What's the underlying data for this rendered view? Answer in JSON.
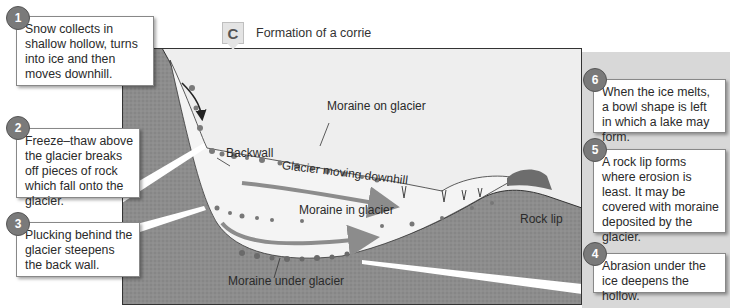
{
  "diagram": {
    "badge": "C",
    "title": "Formation of a corrie",
    "colors": {
      "rock": "#8a8a8a",
      "ice": "#eeeeee",
      "arrow": "#8c8c8c",
      "callout_number_bg": "#7a7a7a",
      "side_panel": "#d8d8d8"
    },
    "callouts": [
      {
        "number": "1",
        "text": "Snow collects in shallow hollow, turns into ice and then moves downhill."
      },
      {
        "number": "2",
        "text": "Freeze–thaw above the glacier breaks off pieces of rock which fall onto the glacier."
      },
      {
        "number": "3",
        "text": "Plucking behind the glacier steepens the back wall."
      },
      {
        "number": "4",
        "text": "Abrasion under the ice deepens the hollow."
      },
      {
        "number": "5",
        "text": "A rock lip forms where erosion is least. It may be covered with moraine deposited by the glacier."
      },
      {
        "number": "6",
        "text": "When the ice melts, a bowl shape is left in which a lake may form."
      }
    ],
    "labels": {
      "moraine_on_glacier": "Moraine on glacier",
      "backwall": "Backwall",
      "glacier_moving": "Glacier moving downhill",
      "moraine_in_glacier": "Moraine in glacier",
      "rock_lip": "Rock lip",
      "moraine_under_glacier": "Moraine under glacier"
    }
  }
}
